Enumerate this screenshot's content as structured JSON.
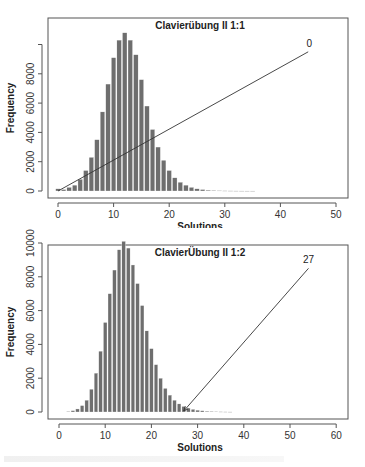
{
  "chart_data": [
    {
      "type": "bar",
      "title": "Clavierübung II 1:1",
      "xlabel": "Solutions",
      "ylabel": "Frequency",
      "xlim": [
        -2,
        52
      ],
      "ylim": [
        0,
        11000
      ],
      "xticks": [
        0,
        10,
        20,
        30,
        40,
        50
      ],
      "yticks": [
        0,
        2000,
        4000,
        6000,
        8000,
        10000
      ],
      "ytick_labels": [
        "0",
        "2000",
        "4000",
        "6000",
        "8000",
        ""
      ],
      "grid": false,
      "annotation": {
        "label": "0",
        "points_to_x": 0,
        "label_x": 45
      },
      "categories": [
        0,
        1,
        2,
        3,
        4,
        5,
        6,
        7,
        8,
        9,
        10,
        11,
        12,
        13,
        14,
        15,
        16,
        17,
        18,
        19,
        20,
        21,
        22,
        23,
        24,
        25,
        26,
        27,
        28,
        29,
        30,
        31,
        32,
        33,
        34,
        35
      ],
      "values": [
        150,
        100,
        250,
        400,
        800,
        1400,
        2300,
        3500,
        5400,
        7300,
        9100,
        10300,
        10800,
        10300,
        9300,
        7600,
        5800,
        4200,
        3000,
        2100,
        1400,
        900,
        600,
        400,
        250,
        150,
        100,
        60,
        40,
        25,
        15,
        10,
        6,
        4,
        3,
        2
      ]
    },
    {
      "type": "bar",
      "title": "ClavierÜbung II 1:2",
      "xlabel": "Solutions",
      "ylabel": "Frequency",
      "xlim": [
        -2,
        62
      ],
      "ylim": [
        0,
        10300
      ],
      "xticks": [
        0,
        10,
        20,
        30,
        40,
        50,
        60
      ],
      "yticks": [
        0,
        2000,
        4000,
        6000,
        8000,
        10000
      ],
      "ytick_labels": [
        "0",
        "2000",
        "4000",
        "6000",
        "8000",
        "10000"
      ],
      "grid": false,
      "annotation": {
        "label": "27",
        "points_to_x": 27,
        "label_x": 54
      },
      "categories": [
        2,
        3,
        4,
        5,
        6,
        7,
        8,
        9,
        10,
        11,
        12,
        13,
        14,
        15,
        16,
        17,
        18,
        19,
        20,
        21,
        22,
        23,
        24,
        25,
        26,
        27,
        28,
        29,
        30,
        31,
        32,
        33,
        34,
        35,
        36,
        37
      ],
      "values": [
        30,
        80,
        180,
        380,
        700,
        1350,
        2300,
        3600,
        5300,
        7000,
        8400,
        9600,
        10100,
        9700,
        8700,
        7600,
        6300,
        4800,
        3750,
        2800,
        2000,
        1400,
        1000,
        700,
        480,
        330,
        230,
        160,
        110,
        75,
        50,
        35,
        25,
        15,
        10,
        6
      ]
    }
  ]
}
